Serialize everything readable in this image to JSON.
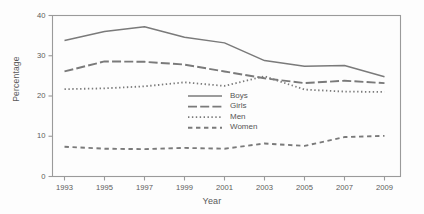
{
  "chart_data": {
    "type": "line",
    "title": "",
    "subtitle": "",
    "xlabel": "Year",
    "ylabel": "Percentage",
    "x": [
      1993,
      1995,
      1997,
      1999,
      2001,
      2003,
      2005,
      2007,
      2009
    ],
    "xtick_labels": [
      "1993",
      "1995",
      "1997",
      "1999",
      "2001",
      "2003",
      "2005",
      "2007",
      "2009"
    ],
    "ytick_labels": [
      "0",
      "10",
      "20",
      "30",
      "40"
    ],
    "yticks": [
      0,
      10,
      20,
      30,
      40
    ],
    "xlim": [
      1992.4,
      2009.8
    ],
    "ylim": [
      0,
      40
    ],
    "grid": false,
    "legend_position": "center",
    "series": [
      {
        "name": "Boys",
        "style": "solid",
        "color": "#7a7a7a",
        "values": [
          33.8,
          36.0,
          37.2,
          34.6,
          33.2,
          28.8,
          27.4,
          27.6,
          24.8
        ]
      },
      {
        "name": "Girls",
        "style": "long-dash",
        "color": "#7a7a7a",
        "values": [
          26.1,
          28.6,
          28.5,
          27.8,
          26.1,
          24.4,
          23.2,
          23.8,
          23.2
        ]
      },
      {
        "name": "Men",
        "style": "dotted",
        "color": "#7a7a7a",
        "values": [
          21.7,
          21.9,
          22.4,
          23.4,
          22.5,
          24.9,
          21.6,
          21.1,
          21.0
        ]
      },
      {
        "name": "Women",
        "style": "dashed",
        "color": "#7a7a7a",
        "values": [
          7.4,
          6.9,
          6.8,
          7.1,
          6.9,
          8.2,
          7.6,
          9.8,
          10.1
        ]
      }
    ]
  },
  "legend": {
    "entries": [
      {
        "label": "Boys"
      },
      {
        "label": "Girls"
      },
      {
        "label": "Men"
      },
      {
        "label": "Women"
      }
    ]
  },
  "axes": {
    "x_title": "Year",
    "y_title": "Percentage"
  }
}
